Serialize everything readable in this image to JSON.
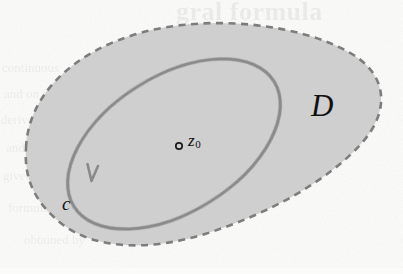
{
  "figure": {
    "type": "complex-analysis-contour-diagram",
    "canvas": {
      "width": 403,
      "height": 274
    },
    "background_color": "#fbfbfa",
    "region": {
      "name": "D",
      "label": "D",
      "fill_color": "#cfcfcf",
      "boundary_style": "dashed",
      "boundary_color": "#7d7d7d",
      "boundary_width": 2.6,
      "dash_length": 7,
      "dash_gap": 5.5,
      "path": "M 26,148 C 28,96 72,52 140,33 C 208,14 300,23 352,54 C 390,77 389,114 360,145 C 326,182 268,214 205,234 C 150,251 96,250 62,224 C 34,202 24,178 26,148 Z"
    },
    "contour": {
      "name": "C",
      "label": "c",
      "stroke_color": "#8a8a8a",
      "stroke_width": 3.2,
      "orientation": "counterclockwise",
      "cx": 174,
      "cy": 144,
      "rx": 118,
      "ry": 68,
      "rotation_deg": -32,
      "arrow": {
        "name": "direction-arrow",
        "x": 90,
        "y": 180,
        "points": "down-left"
      }
    },
    "point": {
      "name": "z0",
      "label": "z",
      "subscript": "0",
      "marker": "open-circle",
      "marker_x": 179,
      "marker_y": 146,
      "marker_radius": 3.2,
      "marker_color": "#1a1a1a"
    }
  },
  "bleed_through": {
    "title": "gral formula",
    "lines": [
      "continuous",
      "and on its",
      "derivative",
      "and if z is",
      "given by",
      "formula",
      "obtained by"
    ]
  }
}
